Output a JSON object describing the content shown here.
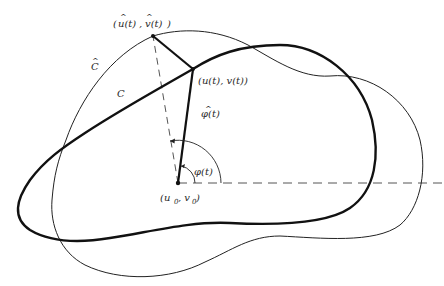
{
  "diagram": {
    "colors": {
      "ink": "#1a1a1a",
      "dashed": "#555555",
      "background": "#ffffff"
    },
    "curves": [
      {
        "id": "C",
        "label": "C",
        "style": "thick"
      },
      {
        "id": "C_hat",
        "label": "C",
        "hat": "^",
        "style": "thin"
      }
    ],
    "points": {
      "center": {
        "label": "(u",
        "sub0": "0",
        "sep": ", v",
        "sub1": "0",
        "close": ")"
      },
      "curve_point": {
        "label": "(u(t), v(t))"
      },
      "hat_point": {
        "label_open": "(",
        "u": "u(t)",
        "sep": ", ",
        "v": "v(t)",
        "close": ")",
        "hat": "^"
      }
    },
    "angles": {
      "phi": {
        "label": "φ(t)"
      },
      "phi_hat": {
        "label": "φ(t)",
        "hat": "^"
      }
    }
  }
}
